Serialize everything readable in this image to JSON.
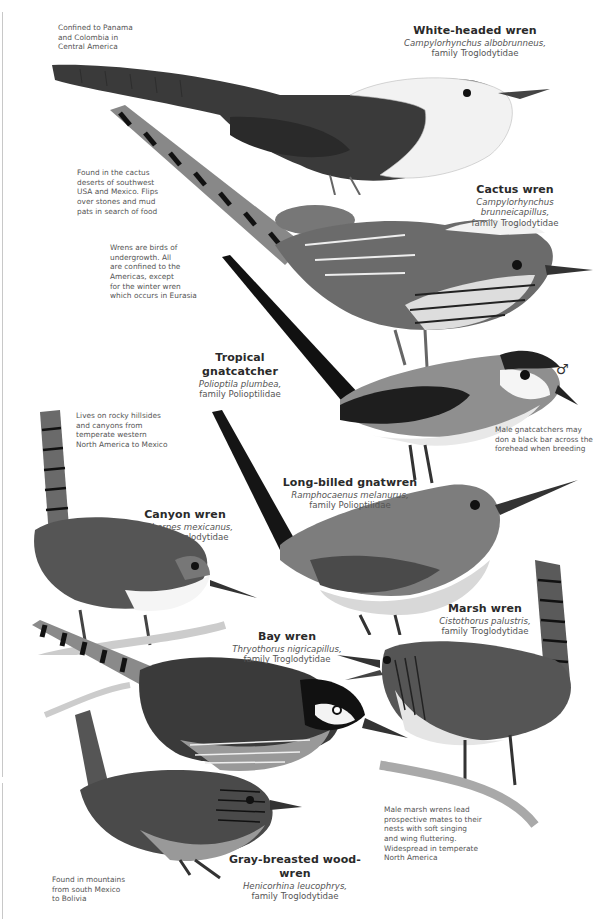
{
  "page": {
    "colors": {
      "text_primary": "#2a2a2a",
      "text_secondary": "#555555",
      "rule": "#c8c8c8",
      "background": "#ffffff"
    }
  },
  "species": [
    {
      "common": "White-headed wren",
      "scientific": "Campylorhynchus albobrunneus,",
      "family": "family Troglodytidae"
    },
    {
      "common": "Cactus wren",
      "scientific": "Campylorhynchus brunneicapillus,",
      "family": "family Troglodytidae"
    },
    {
      "common": "Tropical gnatcatcher",
      "scientific": "Polioptila plumbea,",
      "family": "family Polioptilidae"
    },
    {
      "common": "Long-billed gnatwren",
      "scientific": "Ramphocaenus melanurus,",
      "family": "family Polioptilidae"
    },
    {
      "common": "Canyon wren",
      "scientific": "Catherpes mexicanus,",
      "family": "family Troglodytidae"
    },
    {
      "common": "Marsh wren",
      "scientific": "Cistothorus palustris,",
      "family": "family Troglodytidae"
    },
    {
      "common": "Bay wren",
      "scientific": "Thryothorus nigricapillus,",
      "family": "family Troglodytidae"
    },
    {
      "common": "Gray-breasted wood-wren",
      "scientific": "Henicorhina leucophrys,",
      "family": "family Troglodytidae"
    }
  ],
  "notes": {
    "white_headed": "Confined to Panama\nand Colombia in\nCentral America",
    "cactus": "Found in the cactus\ndeserts of southwest\nUSA and Mexico. Flips\nover stones and mud\npats in search of food",
    "wrens_general": "Wrens are birds of\nundergrowth. All\nare confined to the\nAmericas, except\nfor the winter wren\nwhich occurs in Eurasia",
    "gnatcatcher": "Male gnatcatchers may\ndon a black bar across the\nforehead when breeding",
    "canyon": "Lives on rocky hillsides\nand canyons from\ntemperate western\nNorth America to Mexico",
    "marsh": "Male marsh wrens lead\nprospective mates to their\nnests with soft singing\nand wing fluttering.\nWidespread in temperate\nNorth America",
    "wood_wren": "Found in mountains\nfrom south Mexico\nto Bolivia"
  },
  "symbols": {
    "male": "♂"
  }
}
